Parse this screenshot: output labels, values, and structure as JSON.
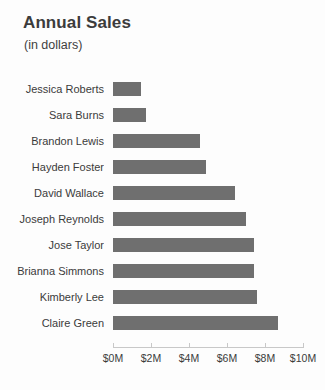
{
  "chart_data": {
    "type": "bar",
    "orientation": "horizontal",
    "title": "Annual Sales",
    "subtitle": "(in dollars)",
    "xlabel": "",
    "ylabel": "",
    "grid": false,
    "legend": null,
    "bar_color": "#6f6f6f",
    "xlim": [
      0,
      10
    ],
    "xticks": [
      0,
      2,
      4,
      6,
      8,
      10
    ],
    "xtick_labels": [
      "$0M",
      "$2M",
      "$4M",
      "$6M",
      "$8M",
      "$10M"
    ],
    "value_unit": "millions of dollars",
    "categories": [
      "Jessica Roberts",
      "Sara Burns",
      "Brandon Lewis",
      "Hayden Foster",
      "David Wallace",
      "Joseph Reynolds",
      "Jose Taylor",
      "Brianna Simmons",
      "Kimberly Lee",
      "Claire Green"
    ],
    "values": [
      1.45,
      1.75,
      4.6,
      4.9,
      6.4,
      7.0,
      7.4,
      7.4,
      7.6,
      8.7
    ]
  }
}
